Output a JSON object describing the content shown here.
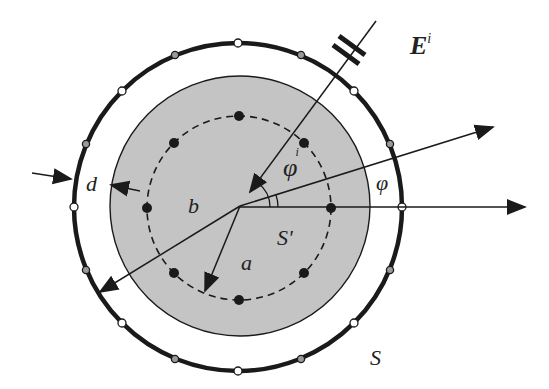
{
  "diagram": {
    "labels": {
      "incident_field": "E",
      "incident_field_sup": "i",
      "incident_angle": "φ",
      "incident_angle_sup": "i",
      "observation_angle": "φ",
      "inner_region": "S'",
      "outer_surface": "S",
      "radius_a": "a",
      "radius_b": "b",
      "gap_d": "d"
    },
    "colors": {
      "shaded_fill": "#c4c4c4",
      "line": "#1a1a1a",
      "marker_gray": "#9a9a9a",
      "marker_white": "#ffffff"
    },
    "geometry": {
      "center": [
        240,
        206
      ],
      "outer_radius": 164,
      "shaded_radius": 130,
      "dashed_radius": 92,
      "outer_marker_count": 16,
      "inner_dot_count": 8,
      "incident_angle_deg": 54,
      "observation_angle_deg": 17
    }
  }
}
